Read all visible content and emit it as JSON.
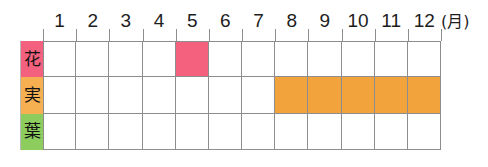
{
  "chart_data": {
    "type": "heatmap",
    "title": "",
    "xlabel": "(月)",
    "ylabel": "",
    "grid": true,
    "legend": "none",
    "categories": [
      "1",
      "2",
      "3",
      "4",
      "5",
      "6",
      "7",
      "8",
      "9",
      "10",
      "11",
      "12"
    ],
    "unit_suffix": "(月)",
    "rows": [
      {
        "label": "花",
        "label_color": "#f4617e",
        "fill_color": "#f4617e",
        "active_months": [
          5
        ],
        "values": [
          0,
          0,
          0,
          0,
          1,
          0,
          0,
          0,
          0,
          0,
          0,
          0
        ]
      },
      {
        "label": "実",
        "label_color": "#f7b051",
        "fill_color": "#f2a33c",
        "active_months": [
          8,
          9,
          10,
          11,
          12
        ],
        "values": [
          0,
          0,
          0,
          0,
          0,
          0,
          0,
          1,
          1,
          1,
          1,
          1
        ]
      },
      {
        "label": "葉",
        "label_color": "#8dcd5e",
        "fill_color": "#8dcd5e",
        "active_months": [],
        "values": [
          0,
          0,
          0,
          0,
          0,
          0,
          0,
          0,
          0,
          0,
          0,
          0
        ]
      }
    ]
  },
  "colors": {
    "flower_pink": "#f4617e",
    "fruit_orange": "#f2a33c",
    "fruit_label_orange": "#f7b051",
    "leaf_green": "#8dcd5e",
    "grid_line": "#8d8d8d",
    "text": "#1d1d1d",
    "background": "#ffffff"
  }
}
